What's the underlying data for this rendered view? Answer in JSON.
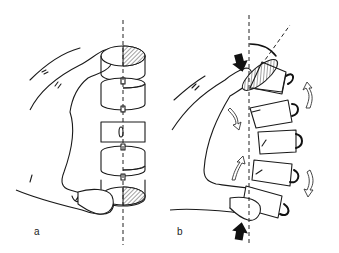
{
  "figure": {
    "panels": [
      {
        "id": "a",
        "label": "a",
        "description": "Hand holding stacked vertebra-like cylinders aligned on a vertical dashed axis"
      },
      {
        "id": "b",
        "label": "b",
        "description": "Hand compressing stacked cylinders, causing them to rotate and tilt off the vertical axis; curved arrows show rotation, black arrows show compression force"
      }
    ]
  },
  "colors": {
    "line": "#1a1a1a",
    "background": "#ffffff",
    "hatch": "#555555",
    "force_arrow": "#111111"
  },
  "panel_b_annotations": {
    "compression_arrows": 2,
    "rotation_arrows_open": 4,
    "angle_arc": true,
    "tilted_axis_dashed": true
  }
}
